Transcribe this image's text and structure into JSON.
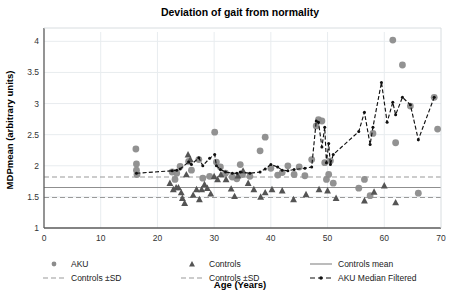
{
  "chart_data": {
    "type": "scatter",
    "title": "Deviation of gait from normality",
    "xlabel": "Age (Years)",
    "ylabel": "MDPmean (arbitrary units)",
    "xlim": [
      0,
      70
    ],
    "ylim": [
      1,
      4.15
    ],
    "xticks": [
      0,
      10,
      20,
      30,
      40,
      50,
      60,
      70
    ],
    "xtick_labels": [
      "0",
      "10",
      "20",
      "30",
      "40",
      "50",
      "60",
      "70"
    ],
    "yticks": [
      1,
      1.5,
      2,
      2.5,
      3,
      3.5,
      4
    ],
    "ytick_labels": [
      "1",
      "1.5",
      "2",
      "2.5",
      "3",
      "3.5",
      "4"
    ],
    "grid": true,
    "legend_position": "below-axes",
    "reference_lines": [
      {
        "name": "Controls mean",
        "value": 1.65,
        "style": "solid",
        "color": "#8f8f8f"
      },
      {
        "name": "Controls +SD",
        "value": 1.82,
        "style": "dashed",
        "color": "#9a9a9a"
      },
      {
        "name": "Controls -SD",
        "value": 1.49,
        "style": "dashed",
        "color": "#9a9a9a"
      }
    ],
    "series": [
      {
        "name": "AKU",
        "marker": "circle",
        "color": "#8c8c8c",
        "points": [
          [
            16.2,
            2.27
          ],
          [
            16.3,
            2.03
          ],
          [
            16.3,
            1.93
          ],
          [
            16.4,
            1.86
          ],
          [
            22.6,
            1.9
          ],
          [
            23.1,
            1.78
          ],
          [
            23.4,
            1.88
          ],
          [
            24.0,
            1.99
          ],
          [
            25.5,
            2.07
          ],
          [
            26.0,
            1.93
          ],
          [
            27.3,
            2.1
          ],
          [
            28.0,
            1.8
          ],
          [
            29.2,
            1.83
          ],
          [
            30.1,
            2.54
          ],
          [
            30.4,
            2.06
          ],
          [
            31.1,
            1.98
          ],
          [
            32.0,
            1.88
          ],
          [
            33.2,
            1.82
          ],
          [
            34.0,
            1.79
          ],
          [
            34.6,
            2.02
          ],
          [
            35.0,
            1.86
          ],
          [
            36.3,
            1.83
          ],
          [
            38.1,
            2.24
          ],
          [
            39.0,
            2.46
          ],
          [
            40.0,
            1.96
          ],
          [
            41.2,
            1.85
          ],
          [
            42.0,
            1.89
          ],
          [
            43.0,
            2.0
          ],
          [
            44.1,
            1.86
          ],
          [
            45.0,
            1.98
          ],
          [
            46.0,
            1.84
          ],
          [
            47.2,
            2.1
          ],
          [
            48.0,
            2.64
          ],
          [
            48.4,
            2.74
          ],
          [
            49.0,
            2.72
          ],
          [
            49.5,
            2.05
          ],
          [
            49.8,
            1.78
          ],
          [
            50.2,
            1.86
          ],
          [
            50.5,
            2.08
          ],
          [
            51.0,
            1.72
          ],
          [
            55.5,
            1.64
          ],
          [
            56.5,
            1.78
          ],
          [
            57.5,
            1.52
          ],
          [
            58.0,
            2.52
          ],
          [
            61.5,
            4.02
          ],
          [
            62.0,
            2.37
          ],
          [
            63.2,
            3.62
          ],
          [
            64.6,
            2.96
          ],
          [
            66.0,
            1.56
          ],
          [
            68.8,
            3.1
          ],
          [
            69.4,
            2.59
          ]
        ]
      },
      {
        "name": "Controls",
        "marker": "triangle",
        "color": "#545454",
        "points": [
          [
            22.2,
            1.72
          ],
          [
            22.8,
            1.62
          ],
          [
            23.3,
            1.65
          ],
          [
            23.7,
            1.65
          ],
          [
            24.2,
            1.57
          ],
          [
            24.4,
            1.48
          ],
          [
            24.8,
            1.4
          ],
          [
            25.1,
            1.86
          ],
          [
            25.4,
            2.18
          ],
          [
            25.8,
            2.1
          ],
          [
            26.3,
            1.53
          ],
          [
            26.9,
            1.62
          ],
          [
            27.4,
            1.46
          ],
          [
            27.8,
            1.62
          ],
          [
            28.3,
            1.7
          ],
          [
            28.8,
            1.64
          ],
          [
            29.4,
            1.55
          ],
          [
            30.0,
            1.83
          ],
          [
            30.6,
            1.78
          ],
          [
            31.2,
            1.86
          ],
          [
            32.1,
            1.78
          ],
          [
            33.0,
            1.63
          ],
          [
            33.6,
            1.51
          ],
          [
            34.2,
            1.84
          ],
          [
            35.1,
            1.92
          ],
          [
            36.0,
            1.72
          ],
          [
            37.0,
            1.62
          ],
          [
            38.2,
            1.5
          ],
          [
            39.0,
            1.57
          ],
          [
            40.2,
            1.62
          ],
          [
            42.0,
            1.6
          ],
          [
            44.0,
            1.46
          ],
          [
            46.2,
            1.54
          ],
          [
            48.5,
            1.62
          ],
          [
            50.0,
            1.6
          ],
          [
            51.5,
            1.48
          ],
          [
            56.5,
            1.44
          ],
          [
            58.2,
            1.58
          ],
          [
            60.0,
            1.68
          ],
          [
            62.0,
            1.41
          ]
        ]
      },
      {
        "name": "AKU Median Filtered",
        "marker": "small-dot",
        "style": "dash-dot",
        "color": "#111111",
        "points": [
          [
            16.3,
            1.88
          ],
          [
            22.6,
            1.92
          ],
          [
            23.4,
            1.93
          ],
          [
            24.0,
            1.95
          ],
          [
            25.5,
            2.06
          ],
          [
            26.0,
            2.02
          ],
          [
            27.3,
            2.13
          ],
          [
            28.0,
            2.0
          ],
          [
            29.2,
            2.12
          ],
          [
            30.1,
            2.18
          ],
          [
            30.4,
            2.0
          ],
          [
            31.1,
            1.94
          ],
          [
            32.0,
            1.9
          ],
          [
            33.2,
            1.88
          ],
          [
            34.0,
            1.88
          ],
          [
            34.6,
            1.9
          ],
          [
            36.3,
            1.88
          ],
          [
            38.1,
            1.9
          ],
          [
            39.0,
            1.95
          ],
          [
            40.0,
            2.02
          ],
          [
            41.2,
            1.98
          ],
          [
            42.0,
            1.93
          ],
          [
            43.0,
            1.92
          ],
          [
            44.1,
            1.94
          ],
          [
            46.0,
            1.96
          ],
          [
            47.2,
            1.98
          ],
          [
            48.0,
            2.72
          ],
          [
            48.4,
            2.7
          ],
          [
            49.0,
            2.3
          ],
          [
            49.5,
            2.62
          ],
          [
            49.8,
            2.05
          ],
          [
            50.2,
            2.36
          ],
          [
            50.5,
            2.02
          ],
          [
            51.0,
            2.18
          ],
          [
            55.5,
            2.55
          ],
          [
            56.5,
            2.86
          ],
          [
            57.5,
            2.34
          ],
          [
            58.0,
            2.62
          ],
          [
            59.5,
            3.34
          ],
          [
            60.5,
            2.7
          ],
          [
            61.5,
            3.02
          ],
          [
            62.0,
            2.82
          ],
          [
            63.2,
            3.1
          ],
          [
            64.6,
            2.98
          ],
          [
            66.0,
            2.42
          ],
          [
            68.8,
            3.1
          ]
        ]
      }
    ],
    "annotations": []
  },
  "legend": {
    "items": [
      {
        "label": "AKU",
        "glyph": "circle-marker"
      },
      {
        "label": "Controls",
        "glyph": "triangle-marker"
      },
      {
        "label": "Controls mean",
        "glyph": "solid-line"
      },
      {
        "label": "Controls ±SD",
        "glyph": "dashed-line"
      },
      {
        "label": "Controls ±SD",
        "glyph": "dashed-line"
      },
      {
        "label": "AKU Median Filtered",
        "glyph": "dash-dot-marker-line"
      }
    ]
  },
  "colors": {
    "aku": "#8c8c8c",
    "controls": "#545454",
    "median_filtered": "#111111",
    "mean_line": "#8f8f8f",
    "sd_line": "#9a9a9a",
    "grid": "#e8ecef",
    "axis": "#5a5a5a",
    "background": "#ffffff"
  }
}
